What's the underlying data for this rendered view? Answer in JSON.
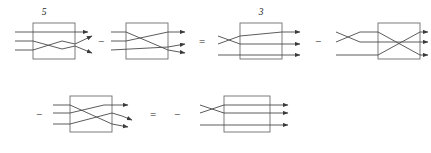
{
  "figure": {
    "kind": "mathematical-equation-of-tangle-diagrams",
    "background_color": "#ffffff",
    "wire_color": "#4a4a4a",
    "box_color": "#6e6e6e",
    "arrow_color": "#3a3a3a",
    "text_color": "#1c1c1c"
  },
  "rows": [
    {
      "id": "row-top",
      "terms": [
        {
          "id": "term-1",
          "coefficient": "5",
          "operator_before": "",
          "box": {
            "x": 33,
            "y": 23,
            "w": 42,
            "h": 36
          },
          "strands": 3,
          "crossings": "inside-lower-pair-plus-outside-right-pair",
          "arrows": 3
        },
        {
          "id": "term-2",
          "coefficient": "",
          "operator_before": "−",
          "box": {
            "x": 126,
            "y": 23,
            "w": 42,
            "h": 36
          },
          "strands": 3,
          "crossings": "inside-upper-pair-long-plus-outside-right-pair",
          "arrows": 3
        },
        {
          "id": "term-3",
          "coefficient": "3",
          "operator_before": "=",
          "box": {
            "x": 240,
            "y": 23,
            "w": 42,
            "h": 36
          },
          "strands": 3,
          "crossings": "outside-left-double-cross",
          "arrows": 3
        },
        {
          "id": "term-4",
          "coefficient": "",
          "operator_before": "−",
          "box": {
            "x": 378,
            "y": 23,
            "w": 42,
            "h": 36
          },
          "strands": 3,
          "crossings": "outside-left-upper-cross-plus-inside-cross",
          "arrows": 3
        }
      ]
    },
    {
      "id": "row-bottom",
      "terms": [
        {
          "id": "term-5",
          "coefficient": "",
          "operator_before": "−",
          "box": {
            "x": 70,
            "y": 96,
            "w": 42,
            "h": 36
          },
          "strands": 3,
          "crossings": "inside-double-cross-plus-outside-right-pair",
          "arrows": 3
        },
        {
          "id": "term-6",
          "coefficient": "",
          "operator_before": "=",
          "operator_after_equals": "−",
          "box": {
            "x": 224,
            "y": 96,
            "w": 46,
            "h": 36
          },
          "strands": 3,
          "crossings": "outside-left-upper-cross",
          "arrows": 3
        }
      ]
    }
  ],
  "operators": {
    "minus": "−",
    "equals": "="
  },
  "labels": {
    "coefficient_first": "5",
    "coefficient_third": "3"
  }
}
